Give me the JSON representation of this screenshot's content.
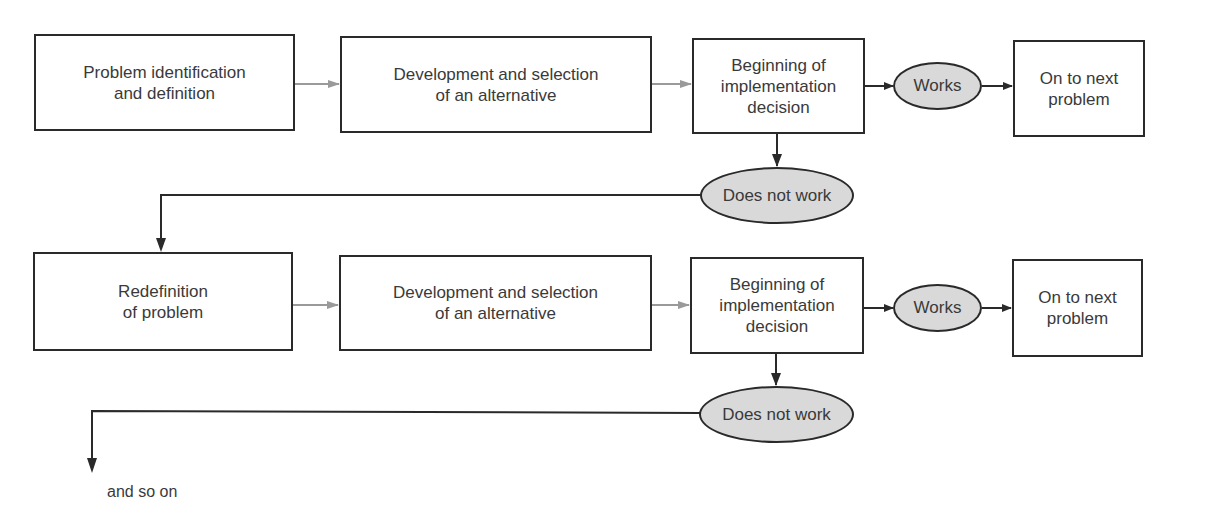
{
  "diagram": {
    "rows": [
      {
        "start": "Problem identification\nand definition",
        "develop": "Development and selection\nof an alternative",
        "implement": "Beginning of\nimplementation\ndecision",
        "works": "Works",
        "next": "On to next\nproblem",
        "fails": "Does not work"
      },
      {
        "start": "Redefinition\nof problem",
        "develop": "Development and selection\nof an alternative",
        "implement": "Beginning of\nimplementation\ndecision",
        "works": "Works",
        "next": "On to next\nproblem",
        "fails": "Does not work"
      }
    ],
    "continuation": "and so on"
  },
  "colors": {
    "stroke": "#2a2a2a",
    "gray_arrow": "#9a9a9a",
    "oval_fill": "#d9d9d9",
    "text": "#3a3a3a"
  }
}
